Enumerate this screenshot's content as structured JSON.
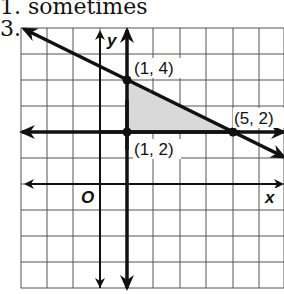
{
  "header": {
    "previous_answer": "1. sometimes",
    "problem_number": "3."
  },
  "graph": {
    "x_axis_label": "x",
    "y_axis_label": "y",
    "origin_label": "O",
    "shading_color": "#d9d9d9",
    "line_color": "#111111",
    "grid_color": "#555555",
    "vertices": [
      {
        "label": "(1, 4)",
        "x": 1,
        "y": 4
      },
      {
        "label": "(5, 2)",
        "x": 5,
        "y": 2
      },
      {
        "label": "(1, 2)",
        "x": 1,
        "y": 2
      }
    ],
    "boundary_lines": [
      {
        "name": "x = 1",
        "type": "vertical",
        "value": 1
      },
      {
        "name": "y = 2",
        "type": "horizontal",
        "value": 2
      },
      {
        "name": "y = -1/2 x + 9/2",
        "type": "slanted",
        "slope": -0.5,
        "intercept": 4.5
      }
    ],
    "grid": {
      "x_min": -3,
      "x_max": 7,
      "y_min": -4,
      "y_max": 6
    }
  }
}
